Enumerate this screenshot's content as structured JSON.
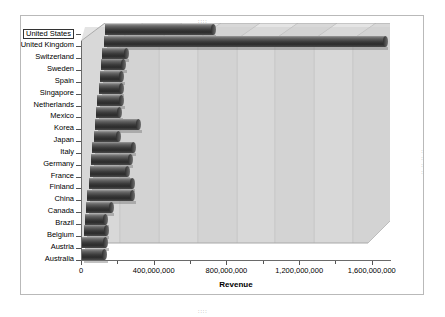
{
  "frame": {
    "handle_dots": "::::"
  },
  "chart_data": {
    "type": "bar",
    "orientation": "horizontal",
    "title": "",
    "xlabel": "Revenue",
    "ylabel": "",
    "xlim": [
      0,
      1700000000
    ],
    "grid": true,
    "legend": "none",
    "selected_category": "United States",
    "xticks": [
      {
        "value": 0,
        "label": "0"
      },
      {
        "value": 200000000,
        "label": ""
      },
      {
        "value": 400000000,
        "label": "400,000,000"
      },
      {
        "value": 600000000,
        "label": ""
      },
      {
        "value": 800000000,
        "label": "800,000,000"
      },
      {
        "value": 1000000000,
        "label": ""
      },
      {
        "value": 1200000000,
        "label": "1,200,000,000"
      },
      {
        "value": 1400000000,
        "label": ""
      },
      {
        "value": 1600000000,
        "label": "1,600,000,000"
      }
    ],
    "categories": [
      "United States",
      "United Kingdom",
      "Switzerland",
      "Sweden",
      "Spain",
      "Singapore",
      "Netherlands",
      "Mexico",
      "Korea",
      "Japan",
      "Italy",
      "Germany",
      "France",
      "Finland",
      "China",
      "Canada",
      "Brazil",
      "Belgium",
      "Austria",
      "Australia"
    ],
    "values": [
      595000000,
      1550000000,
      130000000,
      125000000,
      120000000,
      125000000,
      135000000,
      130000000,
      240000000,
      135000000,
      225000000,
      215000000,
      205000000,
      240000000,
      250000000,
      140000000,
      115000000,
      125000000,
      130000000,
      130000000
    ]
  },
  "colors": {
    "bar_dark": "#2b2b2b",
    "bar_light": "#7c7c7c",
    "plot_wall": "#d6d6d6",
    "plot_floor": "#c9c9c9",
    "frame_border": "#b9b9b9",
    "axis": "#6a6a6a",
    "text": "#000000"
  }
}
